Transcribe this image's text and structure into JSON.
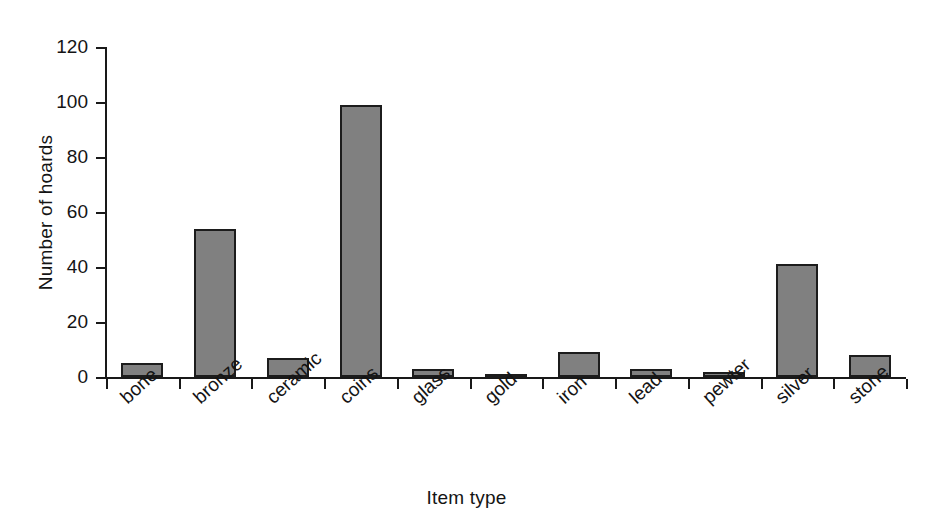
{
  "chart_data": {
    "type": "bar",
    "title": "",
    "subtitle": "",
    "xlabel": "Item type",
    "ylabel": "Number of hoards",
    "categories": [
      "bone",
      "bronze",
      "ceramic",
      "coins",
      "glass",
      "gold",
      "iron",
      "lead",
      "pewter",
      "silver",
      "stone"
    ],
    "values": [
      5,
      54,
      7,
      99,
      3,
      1,
      9,
      3,
      2,
      41,
      8
    ],
    "series": [
      {
        "name": "Number of hoards",
        "values": [
          5,
          54,
          7,
          99,
          3,
          1,
          9,
          3,
          2,
          41,
          8
        ]
      }
    ],
    "ylim": [
      0,
      120
    ],
    "yticks": [
      0,
      20,
      40,
      60,
      80,
      100,
      120
    ],
    "ytick_labels": [
      "0",
      "20",
      "40",
      "60",
      "80",
      "100",
      "120"
    ],
    "grid": false,
    "legend": false,
    "legend_position": "none",
    "bar_color": "#808080",
    "bar_edge_color": "#1c1c1c",
    "axis_color": "#191919",
    "background": "#ffffff",
    "x_label_rotation": -42
  },
  "axes": {
    "y_title": "Number of hoards",
    "x_title": "Item type"
  }
}
